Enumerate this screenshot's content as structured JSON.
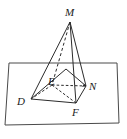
{
  "figure": {
    "width": 127,
    "height": 139,
    "background_color": "#ffffff",
    "stroke_color": "#2b2b2b",
    "label_color": "#1a1a1a"
  },
  "plane": {
    "name": "base-plane-parallelogram",
    "points": "9,63 117,63 119,123 5,125",
    "stroke_color": "#4a4a4a"
  },
  "labels": {
    "apex": "M",
    "interior": "E",
    "right": "N",
    "left": "D",
    "front": "F"
  },
  "points": {
    "M": {
      "x": 70,
      "y": 22
    },
    "E": {
      "x": 52,
      "y": 85
    },
    "N": {
      "x": 86,
      "y": 86
    },
    "D": {
      "x": 31,
      "y": 99
    },
    "F": {
      "x": 76,
      "y": 103
    },
    "T": {
      "x": 66,
      "y": 69
    }
  },
  "edges": {
    "solid": [
      "M-D",
      "M-N",
      "M-F",
      "D-T",
      "T-N",
      "N-F",
      "F-D"
    ],
    "dashed": [
      "M-E",
      "E-D",
      "E-N",
      "E-F"
    ]
  }
}
